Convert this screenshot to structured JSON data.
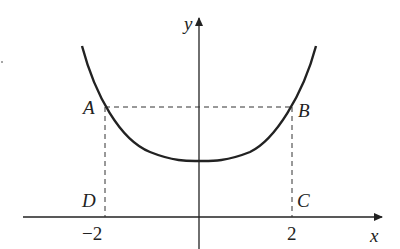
{
  "diagram": {
    "type": "function-graph",
    "axes": {
      "x_label": "x",
      "y_label": "y"
    },
    "ticks": {
      "neg": "−2",
      "pos": "2"
    },
    "points": {
      "A": "A",
      "B": "B",
      "C": "C",
      "D": "D"
    },
    "colors": {
      "ink": "#222222",
      "dash": "#333333"
    }
  }
}
